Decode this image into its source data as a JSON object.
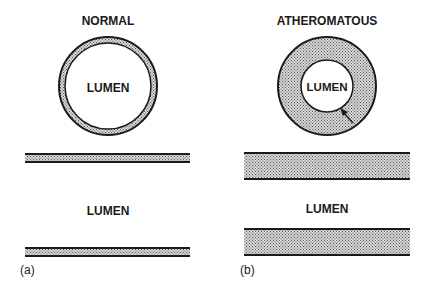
{
  "panels": {
    "a": {
      "title": "NORMAL",
      "cross_section_label": "LUMEN",
      "longitudinal_label": "LUMEN",
      "panel_label": "(a)"
    },
    "b": {
      "title": "ATHEROMATOUS",
      "cross_section_label": "LUMEN",
      "longitudinal_label": "LUMEN",
      "panel_label": "(b)"
    }
  },
  "colors": {
    "outline": "#1a1a1a",
    "wall_fill_pattern": "stippled grey",
    "background": "#ffffff"
  }
}
